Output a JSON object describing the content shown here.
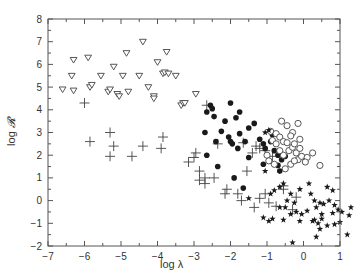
{
  "chart_data": {
    "type": "scatter",
    "title": "",
    "xlabel": "log λ",
    "ylabel": "log 𝓡",
    "xlim": [
      -7,
      1
    ],
    "ylim": [
      -2,
      8
    ],
    "xticks": [
      -7,
      -6,
      -5,
      -4,
      -3,
      -2,
      -1,
      0,
      1
    ],
    "yticks": [
      -2,
      -1,
      0,
      1,
      2,
      3,
      4,
      5,
      6,
      7,
      8
    ],
    "xtick_labels": [
      "−7",
      "−6",
      "−5",
      "−4",
      "−3",
      "−2",
      "−1",
      "0",
      "1"
    ],
    "ytick_labels": [
      "−2",
      "−1",
      "0",
      "1",
      "2",
      "3",
      "4",
      "5",
      "6",
      "7",
      "8"
    ],
    "grid": false,
    "legend": null,
    "series": [
      {
        "name": "open-triangles",
        "marker": "triangle-down-open",
        "points": [
          [
            -6.6,
            4.9
          ],
          [
            -6.3,
            6.2
          ],
          [
            -6.35,
            5.5
          ],
          [
            -6.3,
            4.85
          ],
          [
            -5.9,
            6.3
          ],
          [
            -5.85,
            5.0
          ],
          [
            -5.8,
            5.1
          ],
          [
            -5.55,
            5.5
          ],
          [
            -5.35,
            4.8
          ],
          [
            -5.3,
            4.9
          ],
          [
            -5.2,
            5.9
          ],
          [
            -5.1,
            4.7
          ],
          [
            -5.05,
            4.6
          ],
          [
            -4.95,
            5.5
          ],
          [
            -4.85,
            6.5
          ],
          [
            -4.8,
            4.8
          ],
          [
            -4.5,
            5.5
          ],
          [
            -4.4,
            7.0
          ],
          [
            -4.25,
            5.0
          ],
          [
            -4.1,
            4.6
          ],
          [
            -4.1,
            4.5
          ],
          [
            -4.0,
            6.1
          ],
          [
            -3.85,
            5.6
          ],
          [
            -3.8,
            5.65
          ],
          [
            -3.75,
            6.55
          ],
          [
            -3.7,
            5.6
          ],
          [
            -3.5,
            5.5
          ],
          [
            -3.35,
            4.2
          ],
          [
            -3.3,
            4.3
          ],
          [
            -3.25,
            4.3
          ],
          [
            -2.95,
            4.7
          ]
        ]
      },
      {
        "name": "plus-signs",
        "marker": "plus",
        "points": [
          [
            -6.0,
            4.3
          ],
          [
            -5.85,
            2.6
          ],
          [
            -5.3,
            3.0
          ],
          [
            -5.2,
            2.4
          ],
          [
            -5.3,
            1.95
          ],
          [
            -4.7,
            1.95
          ],
          [
            -4.4,
            2.4
          ],
          [
            -3.85,
            2.8
          ],
          [
            -3.9,
            2.3
          ],
          [
            -3.0,
            1.9
          ],
          [
            -2.95,
            2.1
          ],
          [
            -3.15,
            1.7
          ],
          [
            -2.85,
            1.3
          ],
          [
            -2.7,
            1.0
          ],
          [
            -2.85,
            0.9
          ],
          [
            -2.7,
            0.75
          ],
          [
            -2.45,
            1.0
          ],
          [
            -2.1,
            0.5
          ],
          [
            -2.15,
            0.3
          ],
          [
            -1.8,
            0.3
          ],
          [
            -1.7,
            0.0
          ],
          [
            -1.55,
            1.3
          ],
          [
            -1.2,
            0.1
          ],
          [
            -1.05,
            0.3
          ],
          [
            -1.35,
            -0.3
          ],
          [
            -0.95,
            -0.1
          ],
          [
            -0.55,
            0.65
          ],
          [
            -0.55,
            0.5
          ],
          [
            -0.75,
            -0.25
          ],
          [
            -0.3,
            -0.4
          ],
          [
            -0.2,
            0.15
          ],
          [
            -2.65,
            4.2
          ],
          [
            -2.35,
            2.5
          ],
          [
            -1.65,
            2.55
          ],
          [
            -1.3,
            2.4
          ],
          [
            -1.4,
            2.1
          ],
          [
            -0.85,
            1.95
          ],
          [
            -1.05,
            2.2
          ],
          [
            -1.2,
            2.3
          ]
        ]
      },
      {
        "name": "filled-circles",
        "marker": "circle-filled",
        "points": [
          [
            -2.55,
            4.2
          ],
          [
            -2.5,
            4.05
          ],
          [
            -2.0,
            4.3
          ],
          [
            -2.15,
            3.5
          ],
          [
            -2.7,
            3.0
          ],
          [
            -2.65,
            3.9
          ],
          [
            -2.45,
            3.7
          ],
          [
            -1.85,
            3.65
          ],
          [
            -1.75,
            3.9
          ],
          [
            -2.25,
            3.05
          ],
          [
            -2.05,
            2.8
          ],
          [
            -2.0,
            2.6
          ],
          [
            -1.95,
            2.5
          ],
          [
            -1.8,
            2.3
          ],
          [
            -1.75,
            2.95
          ],
          [
            -1.6,
            2.6
          ],
          [
            -1.5,
            3.2
          ],
          [
            -1.35,
            3.4
          ],
          [
            -1.2,
            2.7
          ],
          [
            -1.1,
            2.5
          ],
          [
            -1.05,
            2.3
          ],
          [
            -0.9,
            2.6
          ],
          [
            -0.8,
            2.2
          ],
          [
            -0.7,
            2.0
          ],
          [
            -0.6,
            1.8
          ],
          [
            -1.5,
            1.9
          ],
          [
            -2.4,
            2.6
          ],
          [
            -2.65,
            2.0
          ],
          [
            -2.35,
            1.5
          ],
          [
            -1.65,
            0.55
          ],
          [
            -1.9,
            1.0
          ],
          [
            -1.1,
            1.6
          ],
          [
            -0.65,
            1.3
          ],
          [
            -0.85,
            2.9
          ],
          [
            -0.7,
            1.55
          ],
          [
            -0.5,
            1.95
          ]
        ]
      },
      {
        "name": "open-circles",
        "marker": "circle-open",
        "points": [
          [
            -0.9,
            3.05
          ],
          [
            -0.75,
            2.95
          ],
          [
            -0.85,
            2.65
          ],
          [
            -0.65,
            2.8
          ],
          [
            -0.55,
            2.6
          ],
          [
            -0.45,
            2.55
          ],
          [
            -0.4,
            2.2
          ],
          [
            -0.3,
            2.35
          ],
          [
            -0.2,
            2.1
          ],
          [
            -0.15,
            1.8
          ],
          [
            -0.05,
            1.95
          ],
          [
            0.1,
            1.9
          ],
          [
            -0.55,
            2.0
          ],
          [
            -0.65,
            2.2
          ],
          [
            -0.75,
            2.5
          ],
          [
            -1.0,
            2.0
          ],
          [
            -0.95,
            1.75
          ],
          [
            -0.8,
            1.6
          ],
          [
            -0.5,
            1.4
          ],
          [
            -0.35,
            1.6
          ],
          [
            -0.25,
            1.75
          ],
          [
            -0.1,
            2.3
          ],
          [
            -0.3,
            3.0
          ],
          [
            -0.1,
            2.7
          ],
          [
            0.05,
            1.7
          ],
          [
            0.25,
            2.1
          ],
          [
            0.45,
            1.55
          ],
          [
            -0.45,
            3.3
          ],
          [
            -0.6,
            3.5
          ],
          [
            -0.15,
            3.4
          ],
          [
            -0.35,
            2.85
          ],
          [
            -0.25,
            2.5
          ]
        ]
      },
      {
        "name": "filled-stars",
        "marker": "star-filled",
        "points": [
          [
            -1.05,
            1.3
          ],
          [
            -0.9,
            0.3
          ],
          [
            -0.8,
            0.45
          ],
          [
            -0.65,
            0.6
          ],
          [
            -0.55,
            0.75
          ],
          [
            -0.35,
            0.3
          ],
          [
            -0.45,
            0.0
          ],
          [
            -0.25,
            -0.1
          ],
          [
            -0.1,
            0.5
          ],
          [
            0.15,
            0.75
          ],
          [
            0.2,
            0.3
          ],
          [
            0.3,
            0.0
          ],
          [
            0.35,
            -0.3
          ],
          [
            0.45,
            -0.1
          ],
          [
            0.55,
            -0.15
          ],
          [
            0.65,
            0.6
          ],
          [
            0.8,
            0.45
          ],
          [
            0.7,
            0.0
          ],
          [
            0.85,
            -0.2
          ],
          [
            0.8,
            -0.55
          ],
          [
            0.5,
            -0.6
          ],
          [
            0.3,
            -0.85
          ],
          [
            0.1,
            -0.45
          ],
          [
            -0.05,
            -0.6
          ],
          [
            -0.2,
            -0.5
          ],
          [
            -0.35,
            -0.6
          ],
          [
            -0.5,
            -0.3
          ],
          [
            -0.65,
            -0.3
          ],
          [
            -0.85,
            -0.8
          ],
          [
            -0.95,
            -0.9
          ],
          [
            -0.55,
            -0.85
          ],
          [
            -0.1,
            -0.9
          ],
          [
            0.25,
            -0.9
          ],
          [
            0.4,
            -1.0
          ],
          [
            0.65,
            -1.1
          ],
          [
            0.85,
            -1.05
          ],
          [
            0.35,
            -1.6
          ],
          [
            0.5,
            -0.8
          ],
          [
            0.95,
            -0.4
          ],
          [
            1.05,
            -0.5
          ],
          [
            1.0,
            -0.95
          ],
          [
            1.25,
            -0.65
          ],
          [
            1.3,
            -0.3
          ],
          [
            -1.5,
            0.1
          ],
          [
            -1.1,
            -0.75
          ],
          [
            -0.3,
            -1.85
          ],
          [
            0.45,
            -1.25
          ],
          [
            1.2,
            -1.5
          ],
          [
            -1.05,
            3.0
          ],
          [
            -0.95,
            3.1
          ]
        ]
      }
    ]
  },
  "axes": {
    "x_label": "log λ",
    "y_label_prefix": "log ",
    "y_label_symbol": "𝓡"
  }
}
